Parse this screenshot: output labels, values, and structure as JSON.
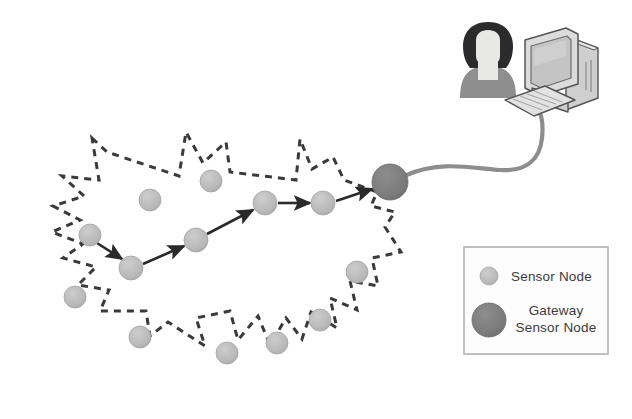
{
  "diagram": {
    "background_color": "#ffffff",
    "boundary": {
      "name": "sensor-field-boundary",
      "style": "dashed",
      "color": "#3a3a3a",
      "dash": "7 6",
      "width": 3
    },
    "colors": {
      "sensor_node": "#b9b9b9",
      "sensor_node_stroke": "#a3a3a3",
      "gateway_node": "#7b7b7b",
      "gateway_node_stroke": "#6a6a6a",
      "arrow": "#2a2a2a",
      "cable": "#8d8d8d",
      "legend_border": "#b0b0b0",
      "legend_background": "#fdfdfd",
      "text": "#3b3b3b",
      "person_hair": "#2b2b2b",
      "person_face": "#e8e8e4",
      "person_body": "#8e8e8e",
      "computer_body": "#d9d9d9",
      "computer_outline": "#555555",
      "computer_screen": "#c4c4c4"
    },
    "sensor_nodes": [
      {
        "id": "n1",
        "cx": 90,
        "cy": 235,
        "r": 11,
        "on_route": true
      },
      {
        "id": "n2",
        "cx": 131,
        "cy": 268,
        "r": 12,
        "on_route": true
      },
      {
        "id": "n3",
        "cx": 196,
        "cy": 240,
        "r": 12,
        "on_route": true
      },
      {
        "id": "n4",
        "cx": 265,
        "cy": 203,
        "r": 12,
        "on_route": true
      },
      {
        "id": "n5",
        "cx": 323,
        "cy": 203,
        "r": 12,
        "on_route": true
      },
      {
        "id": "n6",
        "cx": 150,
        "cy": 200,
        "r": 11,
        "on_route": false
      },
      {
        "id": "n7",
        "cx": 211,
        "cy": 181,
        "r": 11,
        "on_route": false
      },
      {
        "id": "n8",
        "cx": 75,
        "cy": 297,
        "r": 11,
        "on_route": false
      },
      {
        "id": "n9",
        "cx": 140,
        "cy": 337,
        "r": 11,
        "on_route": false
      },
      {
        "id": "n10",
        "cx": 227,
        "cy": 353,
        "r": 11,
        "on_route": false
      },
      {
        "id": "n11",
        "cx": 277,
        "cy": 343,
        "r": 11,
        "on_route": false
      },
      {
        "id": "n12",
        "cx": 320,
        "cy": 320,
        "r": 11,
        "on_route": false
      },
      {
        "id": "n13",
        "cx": 357,
        "cy": 272,
        "r": 11,
        "on_route": false
      }
    ],
    "gateway_node": {
      "id": "gw",
      "cx": 390,
      "cy": 182,
      "r": 18,
      "label": "Gateway Sensor Node"
    },
    "route_hops": [
      {
        "from": "n1",
        "to": "n2"
      },
      {
        "from": "n2",
        "to": "n3"
      },
      {
        "from": "n3",
        "to": "n4"
      },
      {
        "from": "n4",
        "to": "n5"
      },
      {
        "from": "n5",
        "to": "gw"
      }
    ],
    "cable": {
      "name": "gateway-to-computer-cable",
      "from": "gateway_node",
      "to": "computer-keyboard"
    },
    "user": {
      "name": "user-person-icon",
      "cx": 488,
      "cy": 62
    },
    "computer": {
      "name": "desktop-computer-icon",
      "cx": 558,
      "cy": 62
    }
  },
  "legend": {
    "name": "legend-box",
    "items": [
      {
        "id": "legend-sensor",
        "label": "Sensor Node",
        "swatch": "sensor",
        "r": 9
      },
      {
        "id": "legend-gateway",
        "label_line1": "Gateway",
        "label_line2": "Sensor Node",
        "swatch": "gateway",
        "r": 17
      }
    ]
  }
}
